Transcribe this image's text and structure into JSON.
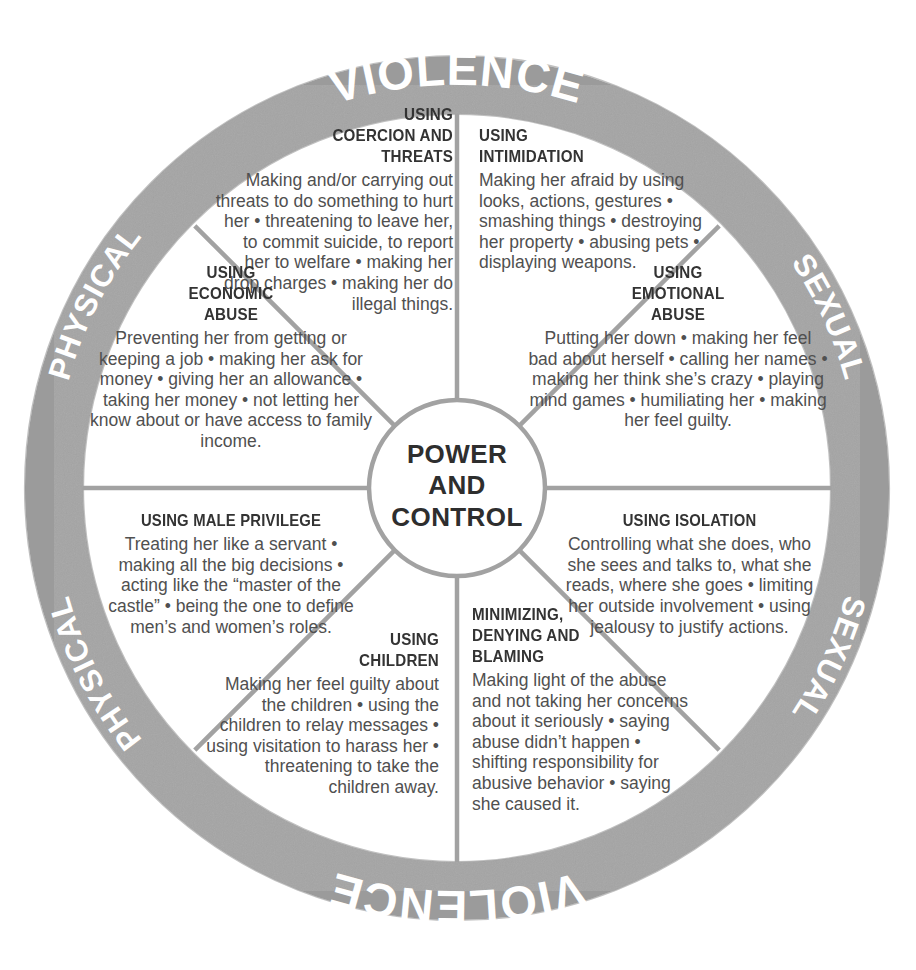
{
  "diagram": {
    "hub": {
      "lines": [
        "POWER",
        "AND",
        "CONTROL"
      ],
      "text": "POWER AND CONTROL"
    },
    "outer_ring": {
      "top_arc": {
        "left_word": "PHYSICAL",
        "center_word": "VIOLENCE",
        "right_word": "SEXUAL"
      },
      "bottom_arc": {
        "left_word": "PHYSICAL",
        "center_word": "VIOLENCE",
        "right_word": "SEXUAL"
      }
    },
    "colors": {
      "ring_gray": "#9b9b9b",
      "spoke_gray": "#a0a0a0",
      "title_text": "#333333",
      "body_text": "#505050",
      "ring_text": "#ffffff",
      "background": "#ffffff"
    },
    "segments": [
      {
        "id": "coercion-threats",
        "title_lines": [
          "USING",
          "COERCION AND",
          "THREATS"
        ],
        "title": "USING COERCION AND THREATS",
        "body": "Making and/or carrying out threats to do something to hurt her • threatening to leave her, to commit suicide, to report her to welfare • making her drop charges • making her do illegal things.",
        "align": "right"
      },
      {
        "id": "intimidation",
        "title_lines": [
          "USING",
          "INTIMIDATION"
        ],
        "title": "USING INTIMIDATION",
        "body": "Making her afraid by using looks, actions, gestures • smashing things • destroying her property • abusing pets • displaying weapons.",
        "align": "left"
      },
      {
        "id": "emotional-abuse",
        "title_lines": [
          "USING",
          "EMOTIONAL",
          "ABUSE"
        ],
        "title": "USING EMOTIONAL ABUSE",
        "body": "Putting her down • making her feel bad about herself • calling her names • making her think she’s crazy • playing mind games • humiliating her • making her feel guilty.",
        "align": "center"
      },
      {
        "id": "isolation",
        "title_lines": [
          "USING ISOLATION"
        ],
        "title": "USING ISOLATION",
        "body": "Controlling what she does, who she sees and talks to, what she reads, where she goes • limiting her outside involvement • using jealousy to justify actions.",
        "align": "center"
      },
      {
        "id": "minimizing-denying-blaming",
        "title_lines": [
          "MINIMIZING,",
          "DENYING AND",
          "BLAMING"
        ],
        "title": "MINIMIZING, DENYING AND BLAMING",
        "body": "Making light of the abuse and not taking her concerns about it seriously • saying abuse didn’t happen • shifting responsibility for abusive behavior • saying she caused it.",
        "align": "left"
      },
      {
        "id": "using-children",
        "title_lines": [
          "USING",
          "CHILDREN"
        ],
        "title": "USING CHILDREN",
        "body": "Making her feel guilty about the children • using the children to relay messages • using visitation to harass her • threatening to take the children away.",
        "align": "right"
      },
      {
        "id": "male-privilege",
        "title_lines": [
          "USING MALE PRIVILEGE"
        ],
        "title": "USING MALE PRIVILEGE",
        "body": "Treating her like a servant • making all the big decisions • acting like the “master of the castle” • being the one to define men’s and women’s roles.",
        "align": "center"
      },
      {
        "id": "economic-abuse",
        "title_lines": [
          "USING",
          "ECONOMIC",
          "ABUSE"
        ],
        "title": "USING ECONOMIC ABUSE",
        "body": "Preventing her from getting or keeping a job • making her ask for money • giving her an allowance • taking her money • not letting her know about or have access to family income.",
        "align": "center"
      }
    ]
  }
}
